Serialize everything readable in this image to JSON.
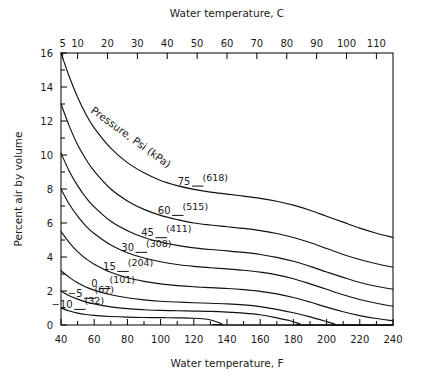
{
  "chart_data": {
    "type": "line",
    "title": "",
    "xlabel": "Water temperature, F",
    "xlabel_top": "Water temperature, C",
    "ylabel": "Percent air by volume",
    "xlim": [
      40,
      240
    ],
    "ylim": [
      0,
      16
    ],
    "xlim_top": [
      4.44,
      115.56
    ],
    "grid": false,
    "legend_position": "inline-curve-labels",
    "xticks": [
      40,
      60,
      80,
      100,
      120,
      140,
      160,
      180,
      200,
      220,
      240
    ],
    "xticklabels": [
      "40",
      "60",
      "80",
      "100",
      "120",
      "140",
      "160",
      "180",
      "200",
      "220",
      "240"
    ],
    "xminorticks": [
      50,
      70,
      90,
      110,
      130,
      150,
      170,
      190,
      210,
      230
    ],
    "xticks_top": [
      5,
      10,
      20,
      30,
      40,
      50,
      60,
      70,
      80,
      90,
      100,
      110
    ],
    "xticklabels_top": [
      "5",
      "10",
      "20",
      "30",
      "40",
      "50",
      "60",
      "70",
      "80",
      "90",
      "100",
      "110"
    ],
    "yticks": [
      0,
      2,
      4,
      6,
      8,
      10,
      12,
      14,
      16
    ],
    "yticklabels": [
      "0",
      "2",
      "4",
      "6",
      "8",
      "10",
      "12",
      "14",
      "16"
    ],
    "yminorticks": [
      1,
      3,
      5,
      7,
      9,
      11,
      13,
      15
    ],
    "annotation_pressure": "Pressure, Psi (kPa)",
    "series": [
      {
        "name": "75",
        "label_psi": "75",
        "label_kpa": "(618)",
        "x": [
          40,
          45,
          50,
          55,
          60,
          70,
          80,
          90,
          100,
          110,
          120,
          130,
          140,
          150,
          160,
          170,
          180,
          190,
          200,
          210,
          220,
          230,
          240
        ],
        "values": [
          16.0,
          14.6,
          13.4,
          12.4,
          11.6,
          10.4,
          9.55,
          8.95,
          8.5,
          8.2,
          7.98,
          7.82,
          7.7,
          7.58,
          7.45,
          7.28,
          7.05,
          6.75,
          6.4,
          6.05,
          5.7,
          5.4,
          5.15
        ]
      },
      {
        "name": "60",
        "label_psi": "60",
        "label_kpa": "(515)",
        "x": [
          40,
          45,
          50,
          55,
          60,
          70,
          80,
          90,
          100,
          110,
          120,
          130,
          140,
          150,
          160,
          170,
          180,
          190,
          200,
          210,
          220,
          230,
          240
        ],
        "values": [
          13.0,
          11.7,
          10.6,
          9.75,
          9.05,
          8.0,
          7.3,
          6.8,
          6.45,
          6.2,
          6.0,
          5.88,
          5.78,
          5.68,
          5.55,
          5.38,
          5.15,
          4.85,
          4.5,
          4.15,
          3.85,
          3.6,
          3.4
        ]
      },
      {
        "name": "45",
        "label_psi": "45",
        "label_kpa": "(411)",
        "x": [
          40,
          45,
          50,
          55,
          60,
          70,
          80,
          90,
          100,
          110,
          120,
          130,
          140,
          150,
          160,
          170,
          180,
          190,
          200,
          210,
          220,
          230,
          240
        ],
        "values": [
          10.1,
          9.05,
          8.2,
          7.5,
          6.95,
          6.1,
          5.55,
          5.15,
          4.88,
          4.68,
          4.54,
          4.44,
          4.36,
          4.27,
          4.15,
          3.98,
          3.75,
          3.45,
          3.12,
          2.8,
          2.5,
          2.28,
          2.1
        ]
      },
      {
        "name": "30",
        "label_psi": "30",
        "label_kpa": "(308)",
        "x": [
          40,
          45,
          50,
          55,
          60,
          70,
          80,
          90,
          100,
          110,
          120,
          130,
          140,
          150,
          160,
          170,
          180,
          190,
          200,
          210,
          220,
          230,
          240
        ],
        "values": [
          8.0,
          7.1,
          6.4,
          5.82,
          5.38,
          4.7,
          4.25,
          3.94,
          3.72,
          3.56,
          3.45,
          3.37,
          3.3,
          3.22,
          3.11,
          2.95,
          2.72,
          2.42,
          2.1,
          1.78,
          1.5,
          1.28,
          1.1
        ]
      },
      {
        "name": "15",
        "label_psi": "15",
        "label_kpa": "(204)",
        "x": [
          40,
          45,
          50,
          55,
          60,
          70,
          80,
          90,
          100,
          110,
          120,
          130,
          140,
          150,
          160,
          170,
          180,
          190,
          200,
          210,
          220,
          230,
          240
        ],
        "values": [
          5.5,
          4.85,
          4.32,
          3.9,
          3.58,
          3.1,
          2.78,
          2.57,
          2.42,
          2.32,
          2.25,
          2.2,
          2.15,
          2.08,
          1.98,
          1.83,
          1.62,
          1.35,
          1.05,
          0.78,
          0.55,
          0.38,
          0.25
        ]
      },
      {
        "name": "0",
        "label_psi": "0",
        "label_kpa": "(101)",
        "x": [
          40,
          45,
          50,
          55,
          60,
          70,
          80,
          90,
          100,
          110,
          120,
          130,
          140,
          150,
          160,
          170,
          180,
          190,
          200,
          205,
          207,
          240
        ],
        "values": [
          3.2,
          2.8,
          2.48,
          2.23,
          2.05,
          1.78,
          1.6,
          1.48,
          1.4,
          1.35,
          1.31,
          1.28,
          1.24,
          1.18,
          1.08,
          0.92,
          0.72,
          0.48,
          0.2,
          0.05,
          0.0,
          0.0
        ]
      },
      {
        "name": "-5",
        "label_psi": "−5",
        "label_kpa": "(67)",
        "x": [
          40,
          45,
          50,
          55,
          60,
          70,
          80,
          90,
          100,
          110,
          120,
          130,
          140,
          150,
          160,
          170,
          178,
          184,
          186,
          240
        ],
        "values": [
          2.0,
          1.72,
          1.52,
          1.36,
          1.24,
          1.07,
          0.96,
          0.9,
          0.86,
          0.84,
          0.82,
          0.8,
          0.76,
          0.7,
          0.6,
          0.42,
          0.25,
          0.06,
          0.0,
          0.0
        ]
      },
      {
        "name": "-10",
        "label_psi": "−10",
        "label_kpa": "(32)",
        "x": [
          40,
          45,
          50,
          55,
          60,
          70,
          80,
          90,
          100,
          110,
          120,
          128,
          134,
          137,
          139,
          240
        ],
        "values": [
          1.0,
          0.82,
          0.7,
          0.62,
          0.57,
          0.5,
          0.46,
          0.44,
          0.43,
          0.42,
          0.4,
          0.34,
          0.18,
          0.06,
          0.0,
          0.0
        ]
      }
    ]
  },
  "axes": {
    "top_title": "Water temperature, C",
    "bottom_title": "Water temperature, F",
    "left_title": "Percent air by volume"
  },
  "annotations": {
    "pressure_caption": "Pressure, Psi (kPa)"
  }
}
